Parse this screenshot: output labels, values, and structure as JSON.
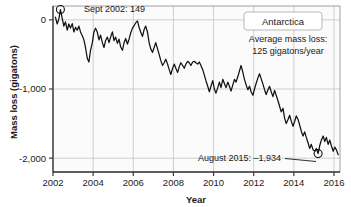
{
  "chart_data": {
    "type": "line",
    "title": "",
    "region_label": "Antarctica",
    "xlabel": "Year",
    "ylabel": "Mass loss (gigatons)",
    "xlim": [
      2002.0,
      2016.3
    ],
    "ylim": [
      -2200,
      200
    ],
    "xticks": [
      2002,
      2004,
      2006,
      2008,
      2010,
      2012,
      2014,
      2016
    ],
    "xtick_labels": [
      "2002",
      "2004",
      "2006",
      "2008",
      "2010",
      "2012",
      "2014",
      "2016"
    ],
    "yticks": [
      0,
      -1000,
      -2000
    ],
    "ytick_labels": [
      "0",
      "-1,000",
      "-2,000"
    ],
    "grid": "both",
    "legend": "none",
    "series": [
      {
        "name": "Antarctica ice mass anomaly",
        "units": "gigatons",
        "color": "#111111",
        "x": [
          2002.12,
          2002.21,
          2002.29,
          2002.37,
          2002.46,
          2002.54,
          2002.62,
          2002.71,
          2002.79,
          2002.87,
          2002.96,
          2003.04,
          2003.12,
          2003.21,
          2003.29,
          2003.37,
          2003.46,
          2003.54,
          2003.62,
          2003.71,
          2003.79,
          2003.87,
          2003.96,
          2004.04,
          2004.12,
          2004.21,
          2004.29,
          2004.37,
          2004.46,
          2004.54,
          2004.62,
          2004.71,
          2004.79,
          2004.87,
          2004.96,
          2005.04,
          2005.12,
          2005.21,
          2005.29,
          2005.37,
          2005.46,
          2005.54,
          2005.62,
          2005.71,
          2005.79,
          2005.87,
          2005.96,
          2006.04,
          2006.12,
          2006.21,
          2006.29,
          2006.37,
          2006.46,
          2006.54,
          2006.62,
          2006.71,
          2006.79,
          2006.87,
          2006.96,
          2007.04,
          2007.12,
          2007.21,
          2007.29,
          2007.37,
          2007.46,
          2007.54,
          2007.62,
          2007.71,
          2007.79,
          2007.87,
          2007.96,
          2008.04,
          2008.12,
          2008.21,
          2008.29,
          2008.37,
          2008.46,
          2008.54,
          2008.62,
          2008.71,
          2008.79,
          2008.87,
          2008.96,
          2009.04,
          2009.12,
          2009.21,
          2009.29,
          2009.37,
          2009.46,
          2009.54,
          2009.62,
          2009.71,
          2009.79,
          2009.87,
          2009.96,
          2010.04,
          2010.12,
          2010.21,
          2010.29,
          2010.37,
          2010.46,
          2010.54,
          2010.62,
          2010.71,
          2010.79,
          2010.87,
          2010.96,
          2011.04,
          2011.12,
          2011.21,
          2011.29,
          2011.37,
          2011.46,
          2011.54,
          2011.62,
          2011.71,
          2011.79,
          2011.87,
          2011.96,
          2012.04,
          2012.12,
          2012.21,
          2012.29,
          2012.37,
          2012.46,
          2012.54,
          2012.62,
          2012.71,
          2012.79,
          2012.87,
          2012.96,
          2013.04,
          2013.12,
          2013.21,
          2013.29,
          2013.37,
          2013.46,
          2013.54,
          2013.62,
          2013.71,
          2013.79,
          2013.87,
          2013.96,
          2014.04,
          2014.12,
          2014.21,
          2014.29,
          2014.37,
          2014.46,
          2014.54,
          2014.62,
          2014.71,
          2014.79,
          2014.87,
          2014.96,
          2015.04,
          2015.12,
          2015.21,
          2015.29,
          2015.37,
          2015.46,
          2015.54,
          2015.62,
          2015.71,
          2015.79,
          2015.87,
          2015.96,
          2016.04,
          2016.12,
          2016.21
        ],
        "y": [
          40,
          -60,
          10,
          149,
          20,
          -90,
          -30,
          -150,
          -60,
          -120,
          -55,
          -175,
          -110,
          -150,
          -90,
          -175,
          -230,
          -290,
          -400,
          -560,
          -610,
          -440,
          -330,
          -175,
          -120,
          -180,
          -290,
          -220,
          -330,
          -400,
          -300,
          -250,
          -330,
          -250,
          -175,
          -300,
          -250,
          -340,
          -280,
          -390,
          -440,
          -330,
          -270,
          -350,
          -280,
          -190,
          -120,
          -85,
          -45,
          -15,
          -110,
          -175,
          -240,
          -140,
          -90,
          -180,
          -330,
          -420,
          -470,
          -400,
          -330,
          -420,
          -500,
          -590,
          -660,
          -620,
          -570,
          -640,
          -720,
          -790,
          -700,
          -640,
          -700,
          -760,
          -680,
          -620,
          -660,
          -700,
          -640,
          -600,
          -620,
          -660,
          -610,
          -600,
          -620,
          -640,
          -610,
          -660,
          -720,
          -800,
          -880,
          -960,
          -1040,
          -960,
          -880,
          -1000,
          -1060,
          -980,
          -900,
          -980,
          -860,
          -920,
          -980,
          -900,
          -960,
          -1030,
          -940,
          -860,
          -900,
          -820,
          -740,
          -660,
          -760,
          -860,
          -940,
          -1010,
          -960,
          -1040,
          -1090,
          -1000,
          -920,
          -840,
          -780,
          -850,
          -930,
          -1010,
          -1080,
          -1010,
          -960,
          -1040,
          -1110,
          -1020,
          -1090,
          -1170,
          -1250,
          -1330,
          -1280,
          -1420,
          -1500,
          -1440,
          -1380,
          -1460,
          -1540,
          -1470,
          -1390,
          -1440,
          -1520,
          -1610,
          -1680,
          -1620,
          -1700,
          -1780,
          -1860,
          -1800,
          -1880,
          -1900,
          -1860,
          -1934,
          -1820,
          -1740,
          -1680,
          -1760,
          -1700,
          -1800,
          -1740,
          -1820,
          -1900,
          -1840,
          -1880,
          -1950
        ]
      }
    ],
    "annotations": [
      {
        "id": "sept-2002",
        "label": "Sept 2002: 149",
        "point_x": 2002.37,
        "point_y": 149,
        "marker": "circle"
      },
      {
        "id": "august-2015",
        "label": "August 2015: –1,934",
        "point_x": 2015.21,
        "point_y": -1934,
        "marker": "circle"
      }
    ],
    "callouts": {
      "average_loss_line1": "Average mass loss:",
      "average_loss_line2": "125 gigatons/year",
      "average_loss_value": 125,
      "average_loss_units": "gigatons/year"
    },
    "colors": {
      "line": "#111111",
      "grid": "#c9c9c9",
      "axis": "#4a4a4a",
      "plot_background": "#fbfbfb",
      "text": "#1a1a1a",
      "box_border": "#b0b0b0",
      "box_fill": "#ffffff"
    }
  }
}
